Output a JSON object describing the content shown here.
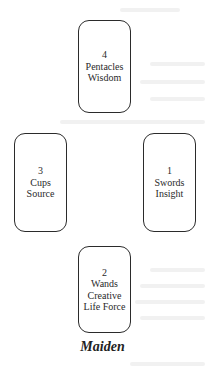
{
  "spread": {
    "cards": [
      {
        "position": "top",
        "number": "4",
        "suit": "Pentacles",
        "meaning": [
          "Wisdom"
        ]
      },
      {
        "position": "left",
        "number": "3",
        "suit": "Cups",
        "meaning": [
          "Source"
        ]
      },
      {
        "position": "right",
        "number": "1",
        "suit": "Swords",
        "meaning": [
          "Insight"
        ]
      },
      {
        "position": "bottom",
        "number": "2",
        "suit": "Wands",
        "meaning": [
          "Creative",
          "Life Force"
        ]
      }
    ],
    "caption": "Maiden"
  }
}
